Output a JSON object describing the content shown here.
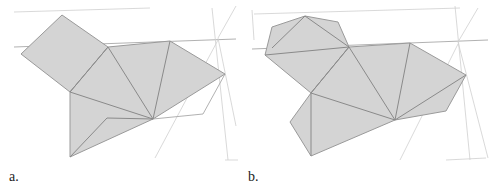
{
  "figure": {
    "panels": [
      {
        "id": "a",
        "label": "a.",
        "description": "Triangulated gray polygon mesh with square flap on upper left"
      },
      {
        "id": "b",
        "label": "b.",
        "description": "Triangulated gray polygon mesh with rounded hexagonal flap on upper left"
      }
    ],
    "colors": {
      "fill": "#d4d4d4",
      "edge": "#8a8a8a",
      "guide": "#cfcfcf",
      "background": "#ffffff"
    }
  }
}
